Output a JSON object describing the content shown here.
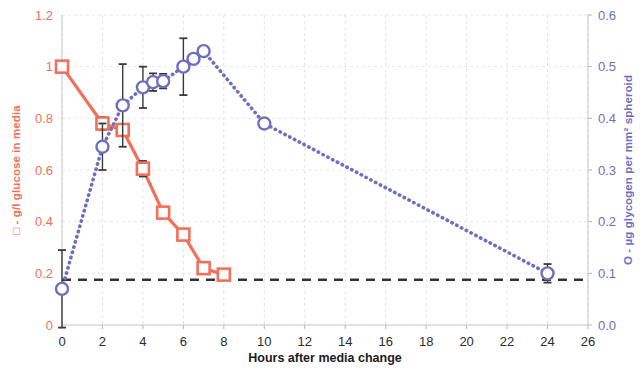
{
  "chart_data": {
    "type": "line",
    "title": "",
    "xlabel": "Hours after media change",
    "xlim": [
      0,
      26
    ],
    "xticks": [
      0,
      2,
      4,
      6,
      8,
      10,
      12,
      14,
      16,
      18,
      20,
      22,
      24,
      26
    ],
    "xtick_labels": [
      "0",
      "2",
      "4",
      "6",
      "8",
      "10",
      "12",
      "14",
      "16",
      "18",
      "20",
      "22",
      "24",
      "26"
    ],
    "grid": true,
    "legend": "inline-in-axis-titles",
    "axes": [
      {
        "id": "left",
        "label": "□ - g/l glucose in media",
        "color": "#f2705a",
        "ylim": [
          0,
          1.2
        ],
        "yticks": [
          0,
          0.2,
          0.4,
          0.6,
          0.8,
          1.0,
          1.2
        ],
        "ytick_labels": [
          "0",
          "0.2",
          "0.4",
          "0.6",
          "0.8",
          "1",
          "1.2"
        ]
      },
      {
        "id": "right",
        "label": "O - µg glycogen per mm² spheroid",
        "color": "#6f6fc0",
        "ylim": [
          0.0,
          0.6
        ],
        "yticks": [
          0.0,
          0.1,
          0.2,
          0.3,
          0.4,
          0.5,
          0.6
        ],
        "ytick_labels": [
          "0.0",
          "0.1",
          "0.2",
          "0.3",
          "0.4",
          "0.5",
          "0.6"
        ]
      }
    ],
    "series": [
      {
        "name": "g/l glucose in media",
        "axis": "left",
        "marker": "square",
        "linestyle": "solid",
        "color": "#f2705a",
        "x": [
          0,
          2,
          3,
          4,
          5,
          6,
          7,
          8
        ],
        "values": [
          1.0,
          0.78,
          0.755,
          0.605,
          0.435,
          0.35,
          0.22,
          0.195
        ],
        "errors": [
          0,
          0.025,
          0.0,
          0.03,
          0.0,
          0.0,
          0.0,
          0.0
        ]
      },
      {
        "name": "µg glycogen per mm² spheroid",
        "axis": "right",
        "marker": "circle",
        "linestyle": "dotted",
        "color": "#6f6fc0",
        "x": [
          0,
          2,
          3,
          4,
          4.5,
          5,
          6,
          6.5,
          7,
          10,
          24
        ],
        "values": [
          0.07,
          0.345,
          0.425,
          0.46,
          0.47,
          0.472,
          0.5,
          0.515,
          0.53,
          0.39,
          0.1
        ],
        "errors": [
          0.075,
          0.045,
          0.08,
          0.04,
          0.017,
          0.014,
          0.055,
          0.0,
          0.0,
          0.0,
          0.018
        ]
      }
    ],
    "reference_line": {
      "name": "detection-threshold",
      "orientation": "horizontal",
      "axis": "left",
      "value": 0.175,
      "style": "dashed",
      "color": "#333333"
    }
  }
}
